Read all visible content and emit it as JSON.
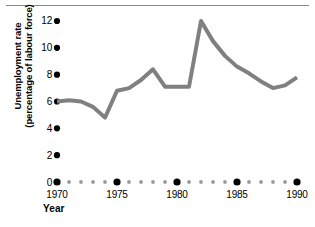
{
  "figure": {
    "top_rule": "horizontal-rule"
  },
  "chart_data": {
    "type": "line",
    "title": "",
    "xlabel": "Year",
    "ylabel": "Unemployment rate (percentage of labour force)",
    "ylabel_line1": "Unemployment rate",
    "ylabel_line2": "(percentage of labour force)",
    "xlim": [
      1970,
      1990
    ],
    "ylim": [
      0,
      12
    ],
    "grid": false,
    "legend": null,
    "line_color": "#808080",
    "line_width": 4,
    "marker_color": "#000000",
    "minor_marker_color": "#9a9a9a",
    "yticks": [
      0,
      2,
      4,
      6,
      8,
      10,
      12
    ],
    "ytick_labels": [
      "0",
      "2",
      "4",
      "6",
      "8",
      "10",
      "12"
    ],
    "xticks": [
      1970,
      1975,
      1980,
      1985,
      1990
    ],
    "xtick_labels": [
      "1970",
      "1975",
      "1980",
      "1985",
      "1990"
    ],
    "x": [
      1970,
      1971,
      1972,
      1973,
      1974,
      1975,
      1976,
      1977,
      1978,
      1979,
      1980,
      1981,
      1982,
      1983,
      1984,
      1985,
      1986,
      1987,
      1988,
      1989,
      1990
    ],
    "values": [
      6.0,
      6.1,
      6.0,
      5.6,
      4.8,
      6.8,
      7.0,
      7.6,
      8.4,
      7.1,
      7.1,
      7.1,
      12.0,
      10.5,
      9.4,
      8.6,
      8.1,
      7.5,
      7.0,
      7.2,
      7.8
    ],
    "series": [
      {
        "name": "Unemployment rate",
        "values": [
          6.0,
          6.1,
          6.0,
          5.6,
          4.8,
          6.8,
          7.0,
          7.6,
          8.4,
          7.1,
          7.1,
          7.1,
          12.0,
          10.5,
          9.4,
          8.6,
          8.1,
          7.5,
          7.0,
          7.2,
          7.8
        ]
      }
    ]
  }
}
